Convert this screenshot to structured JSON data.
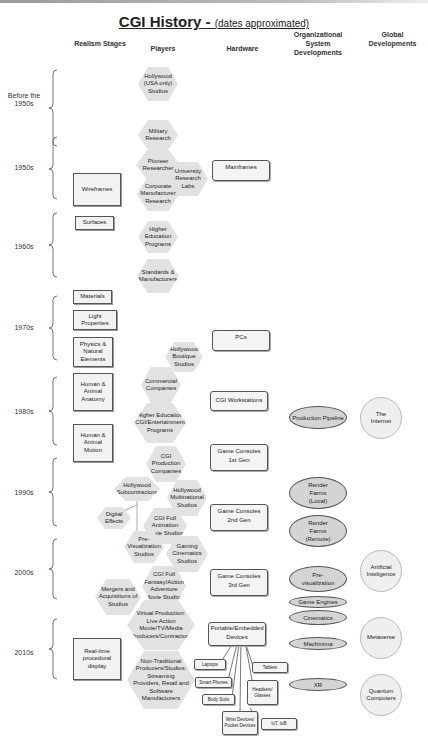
{
  "title": {
    "main": "CGI History - ",
    "sub": "(dates approximated)"
  },
  "columns": {
    "realism": "Realism Stages",
    "players": "Players",
    "hardware": "Hardware",
    "org": "Organizational System Developments",
    "global": "Global Developments"
  },
  "eras": [
    "Before the 1950s",
    "1950s",
    "1960s",
    "1970s",
    "1980s",
    "1990s",
    "2000s",
    "2010s"
  ],
  "realism_stages": [
    "Wireframes",
    "Surfaces",
    "Materials",
    "Light Properties",
    "Physics & Natural Elements",
    "Human & Animal Anatomy",
    "Human & Animal Motion",
    "Real-time procedural display"
  ],
  "players": [
    "Hollywood (USA only) Studios",
    "Military Research",
    "Pioneer Researcher",
    "University Research Labs",
    "Corporate Manufacturer Research",
    "Higher Education Programs",
    "Standards & Manufacturers",
    "Hollywood Boutique Studios",
    "Commercial Companies",
    "Higher Education CGI/Entertainment Programs",
    "CGI Production Companies",
    "Hollywood Subcontractors",
    "Hollywood Multinational Studios",
    "Digital Effects",
    "CGI Full Animation Movie Studios",
    "Pre-Visualization Studios",
    "Gaming Cinematics Studios",
    "CGI Full Fantasy/Action Adventure Movie Studios",
    "Mergers and Acquisitions of Studios",
    "Virtual Production: Live Action Movie/TV/Media Producers/Contractors",
    "Non-Traditional Producers/Studios: Streaming Providers, Retail and Software Manufacturers"
  ],
  "hardware": [
    {
      "line1": "Mainframes",
      "line2": ""
    },
    {
      "line1": "PCs",
      "line2": ""
    },
    {
      "line1": "CGI Workstations",
      "line2": ""
    },
    {
      "line1": "Game Consoles",
      "line2": "1st Gen"
    },
    {
      "line1": "Game Consoles",
      "line2": "2nd Gen"
    },
    {
      "line1": "Game Consoles",
      "line2": "3rd Gen"
    },
    {
      "line1": "Portable/Embedded",
      "line2": "Devices"
    }
  ],
  "devices": [
    "Laptops",
    "Smart Phones",
    "Body Suits",
    "Tablets",
    "Headsets/ Glasses",
    "Wrist Devices/ Pocket Devices",
    "IoT, IoB"
  ],
  "org_developments": [
    "Production Pipeline",
    "Render Farms (Local)",
    "Render Farms (Remote)",
    "Pre-visualization",
    "Game Engines",
    "Cinematics",
    "Machinima",
    "XR"
  ],
  "global_developments": [
    "The Internet",
    "Artificial Inteligence",
    "Metaverse",
    "Quantum Computers"
  ]
}
